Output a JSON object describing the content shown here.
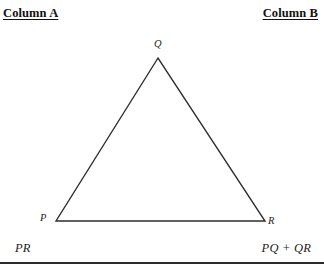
{
  "headers": {
    "column_a": "Column A",
    "column_b": "Column B"
  },
  "figure": {
    "shape": "triangle",
    "vertices": [
      {
        "label": "Q",
        "x": 158,
        "y": 58
      },
      {
        "label": "P",
        "x": 56,
        "y": 221
      },
      {
        "label": "R",
        "x": 265,
        "y": 221
      }
    ],
    "stroke_color": "#2e2e2e",
    "fill_color": "#ffffff"
  },
  "comparison": {
    "column_a_expression": "PR",
    "column_b_expression": "PQ + QR"
  },
  "divider_color": "#2b2b2b"
}
